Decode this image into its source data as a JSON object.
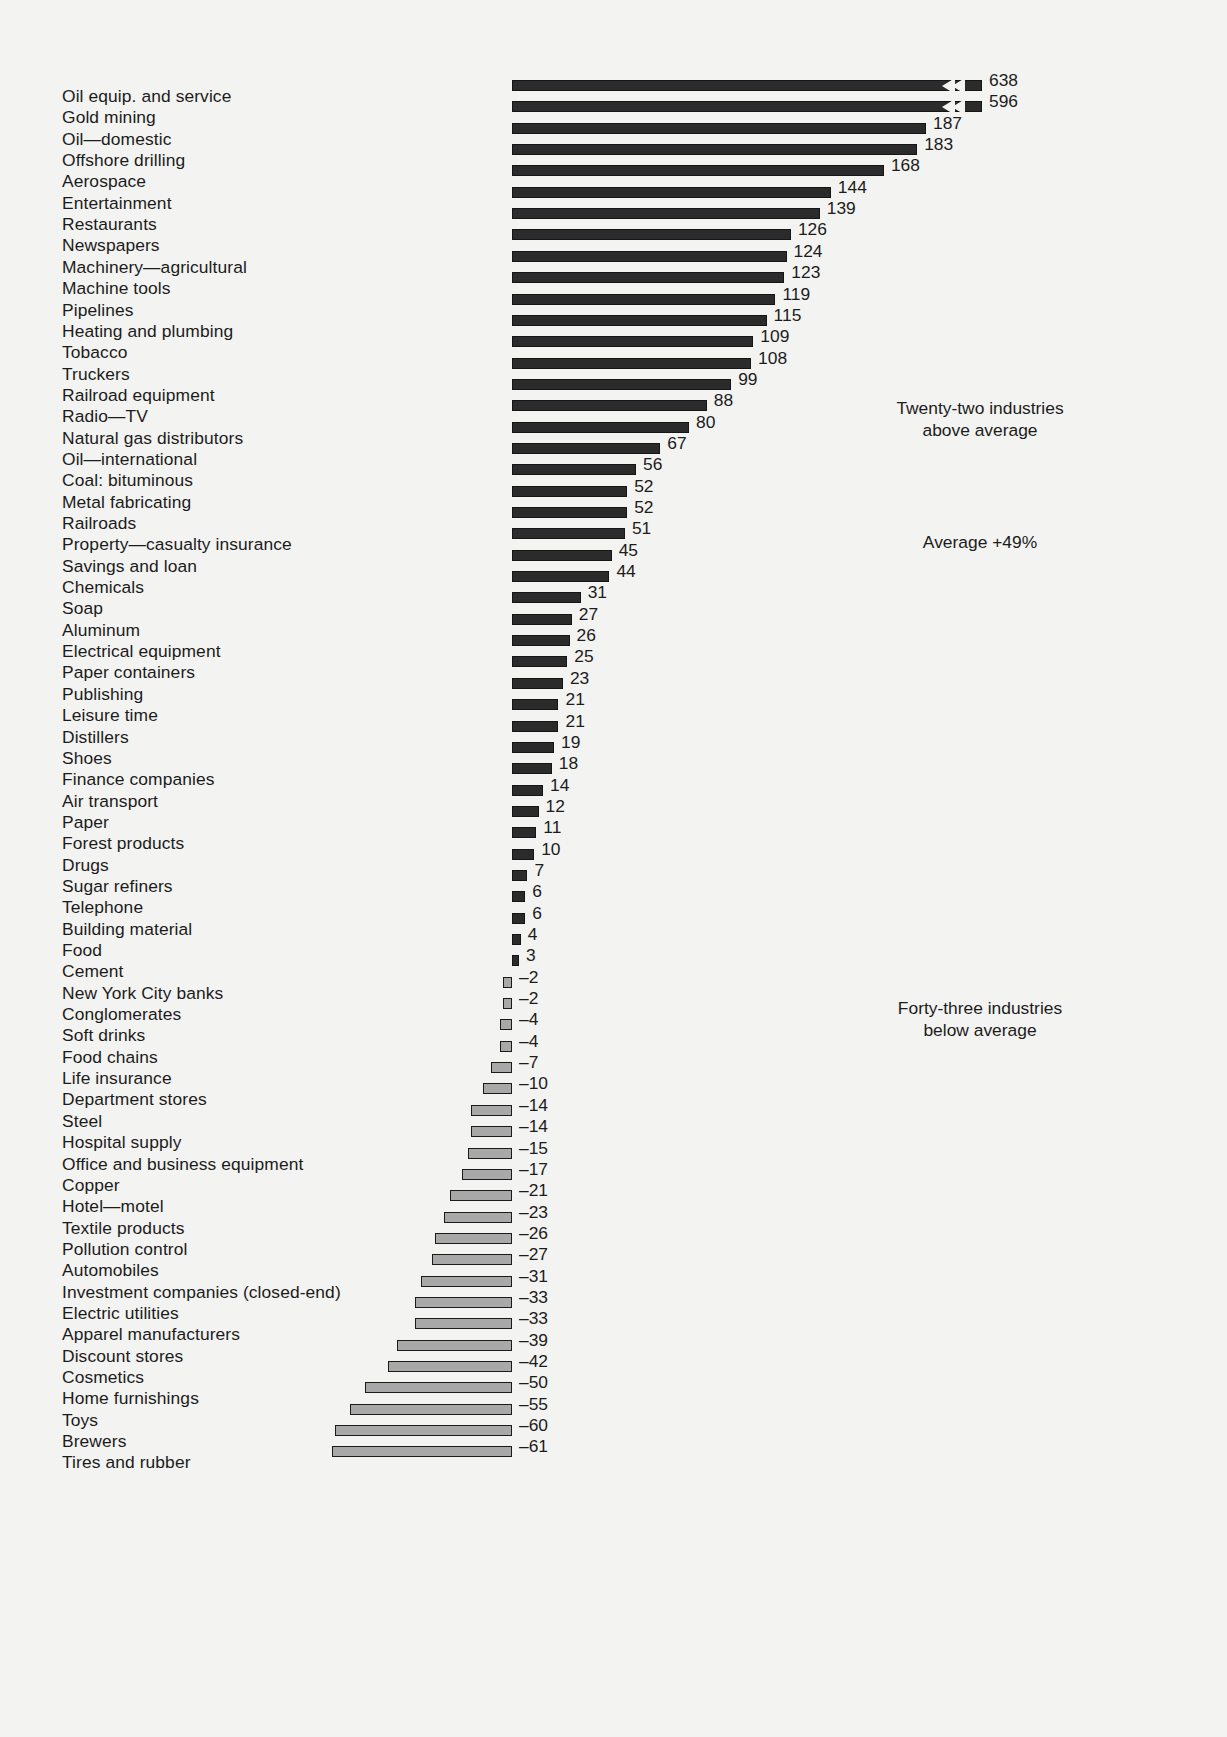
{
  "chart_data": {
    "type": "bar",
    "title": "",
    "subtitle": "",
    "xlabel": "",
    "ylabel": "",
    "orientation": "horizontal",
    "grid": false,
    "legend_position": "none",
    "value_unit": "percent",
    "baseline": 0,
    "xlim": [
      -61,
      638
    ],
    "broken_axis_note": "Top two bars use a broken scale (chevron notch) because their values far exceed the rest.",
    "categories": [
      "Oil equip. and service",
      "Gold mining",
      "Oil—domestic",
      "Offshore drilling",
      "Aerospace",
      "Entertainment",
      "Restaurants",
      "Newspapers",
      "Machinery—agricultural",
      "Machine tools",
      "Pipelines",
      "Heating and plumbing",
      "Tobacco",
      "Truckers",
      "Railroad equipment",
      "Radio—TV",
      "Natural gas distributors",
      "Oil—international",
      "Coal: bituminous",
      "Metal fabricating",
      "Railroads",
      "Property—casualty insurance",
      "Savings and loan",
      "Chemicals",
      "Soap",
      "Aluminum",
      "Electrical equipment",
      "Paper containers",
      "Publishing",
      "Leisure time",
      "Distillers",
      "Shoes",
      "Finance companies",
      "Air transport",
      "Paper",
      "Forest products",
      "Drugs",
      "Sugar refiners",
      "Telephone",
      "Building material",
      "Food",
      "Cement",
      "New York City banks",
      "Conglomerates",
      "Soft drinks",
      "Food chains",
      "Life insurance",
      "Department stores",
      "Steel",
      "Hospital supply",
      "Office and business equipment",
      "Copper",
      "Hotel—motel",
      "Textile products",
      "Pollution control",
      "Automobiles",
      "Investment companies (closed-end)",
      "Electric utilities",
      "Apparel manufacturers",
      "Discount stores",
      "Cosmetics",
      "Home furnishings",
      "Toys",
      "Brewers",
      "Tires and rubber"
    ],
    "values": [
      638,
      596,
      187,
      183,
      168,
      144,
      139,
      126,
      124,
      123,
      119,
      115,
      109,
      108,
      99,
      88,
      80,
      67,
      56,
      52,
      52,
      51,
      45,
      44,
      31,
      27,
      26,
      25,
      23,
      21,
      21,
      19,
      18,
      14,
      12,
      11,
      10,
      7,
      6,
      6,
      4,
      3,
      -2,
      -2,
      -4,
      -4,
      -7,
      -10,
      -14,
      -14,
      -15,
      -17,
      -21,
      -23,
      -26,
      -27,
      -31,
      -33,
      -33,
      -39,
      -42,
      -50,
      -55,
      -60,
      -61
    ],
    "value_labels": [
      "638",
      "596",
      "187",
      "183",
      "168",
      "144",
      "139",
      "126",
      "124",
      "123",
      "119",
      "115",
      "109",
      "108",
      "99",
      "88",
      "80",
      "67",
      "56",
      "52",
      "52",
      "51",
      "45",
      "44",
      "31",
      "27",
      "26",
      "25",
      "23",
      "21",
      "21",
      "19",
      "18",
      "14",
      "12",
      "11",
      "10",
      "7",
      "6",
      "6",
      "4",
      "3",
      "–2",
      "–2",
      "–4",
      "–4",
      "–7",
      "–10",
      "–14",
      "–14",
      "–15",
      "–17",
      "–21",
      "–23",
      "–26",
      "–27",
      "–31",
      "–33",
      "–33",
      "–39",
      "–42",
      "–50",
      "–55",
      "–60",
      "–61"
    ],
    "annotations": [
      {
        "id": "above",
        "text": "Twenty-two industries\nabove average"
      },
      {
        "id": "average",
        "text": "Average +49%"
      },
      {
        "id": "below",
        "text": "Forty-three industries\nbelow average"
      }
    ],
    "colors": {
      "positive_bar": "#2b2b2b",
      "negative_bar": "#a8a8a8",
      "bar_outline": "#1b1b1b",
      "text": "#1c1c1c",
      "background": "#f3f3f1"
    }
  }
}
